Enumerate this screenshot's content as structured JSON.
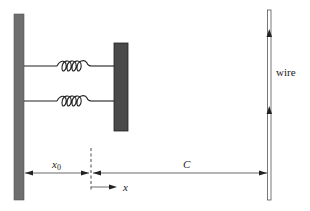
{
  "diagram": {
    "type": "physics-schematic",
    "labels": {
      "wire": "wire",
      "x0_base": "x",
      "x0_sub": "0",
      "C": "C",
      "x": "x"
    },
    "components": {
      "fixed_wall": {
        "x": 14,
        "y": 14,
        "width": 10,
        "height": 186,
        "color": "#6e6e6e"
      },
      "block": {
        "x": 114,
        "y": 43,
        "width": 14,
        "height": 88,
        "color": "#4a4a4a"
      },
      "springs": [
        {
          "y": 66,
          "x_start": 24,
          "coil_start": 57,
          "coil_end": 92,
          "x_end": 114,
          "coils": 4
        },
        {
          "y": 101,
          "x_start": 24,
          "coil_start": 57,
          "coil_end": 92,
          "x_end": 114,
          "coils": 4
        }
      ],
      "wire": {
        "x": 269,
        "y_top": 10,
        "y_bottom": 200,
        "current_arrows_y": [
          35,
          112
        ],
        "direction": "up"
      },
      "equilibrium_marker": {
        "x": 91,
        "y_top": 148,
        "y_bottom": 192,
        "style": "dashed"
      },
      "dimension_line": {
        "y": 173,
        "segments": [
          "x0: wall to equilibrium",
          "C: equilibrium to wire"
        ]
      },
      "x_axis_arrow": {
        "x_start": 91,
        "x_end": 116,
        "y": 187
      }
    },
    "colors": {
      "line": "#333333",
      "wall": "#6e6e6e",
      "block": "#4a4a4a",
      "background": "#ffffff"
    }
  }
}
